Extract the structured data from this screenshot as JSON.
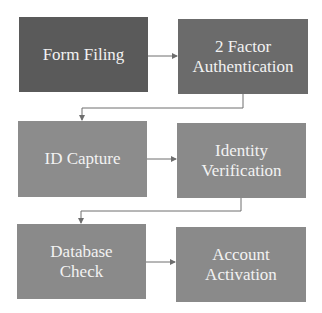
{
  "diagram": {
    "type": "flowchart",
    "steps": [
      {
        "label": "Form Filing",
        "color": "#5a5a5a"
      },
      {
        "label": "2 Factor\nAuthentication",
        "color": "#6b6b6b"
      },
      {
        "label": "ID Capture",
        "color": "#8c8c8c"
      },
      {
        "label": "Identity\nVerification",
        "color": "#8a8a8a"
      },
      {
        "label": "Database\nCheck",
        "color": "#8a8a8a"
      },
      {
        "label": "Account\nActivation",
        "color": "#8a8a8a"
      }
    ],
    "connector_color": "#6e6e6e"
  }
}
